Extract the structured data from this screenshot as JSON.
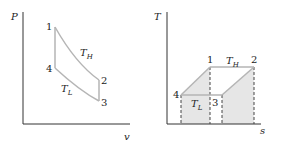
{
  "pv_diagram": {
    "y_axis_label": "P",
    "x_axis_label": "v",
    "points": [
      {
        "id": "1",
        "label": "1"
      },
      {
        "id": "2",
        "label": "2"
      },
      {
        "id": "3",
        "label": "3"
      },
      {
        "id": "4",
        "label": "4"
      }
    ],
    "isotherm_high": {
      "symbol": "T",
      "subscript": "H"
    },
    "isotherm_low": {
      "symbol": "T",
      "subscript": "L"
    }
  },
  "ts_diagram": {
    "y_axis_label": "T",
    "x_axis_label": "s",
    "points": [
      {
        "id": "1",
        "label": "1"
      },
      {
        "id": "2",
        "label": "2"
      },
      {
        "id": "3",
        "label": "3"
      },
      {
        "id": "4",
        "label": "4"
      }
    ],
    "isotherm_high": {
      "symbol": "T",
      "subscript": "H"
    },
    "isotherm_low": {
      "symbol": "T",
      "subscript": "L"
    }
  },
  "colors": {
    "axis": "#333333",
    "cycle_line": "#b5b5b5",
    "shade": "#e6e6e6",
    "dash": "#444444"
  }
}
